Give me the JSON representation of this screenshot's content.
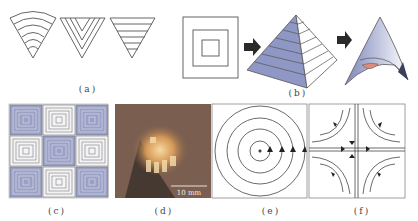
{
  "figure": {
    "panels": [
      {
        "id": "a",
        "label": "(a)",
        "description": "Three inverted triangular fold patterns: concentric arcs, nested V chevrons, horizontal stripes"
      },
      {
        "id": "b",
        "label": "(b)",
        "description": "Concentric squares folded into a pyramid, then into a curved hyperbolic shell"
      },
      {
        "id": "c",
        "label": "(c)",
        "description": "3x3 tessellation of concentric square patterns, alternating blue and white"
      },
      {
        "id": "d",
        "label": "(d)",
        "description": "Photograph of a folded physical specimen",
        "scale_bar": "10 mm"
      },
      {
        "id": "e",
        "label": "(e)",
        "description": "Concentric circles with upward arrows along the horizontal radius"
      },
      {
        "id": "f",
        "label": "(f)",
        "description": "Hyperbolic saddle flow lines with arrows"
      }
    ],
    "colors": {
      "line": "#555555",
      "blue_fill": "#8f97c4",
      "blue_light": "#b9bedc",
      "pink": "#e08a7a",
      "photo_bg": "#7a5a4a",
      "arrow": "#2a2a2a"
    }
  }
}
